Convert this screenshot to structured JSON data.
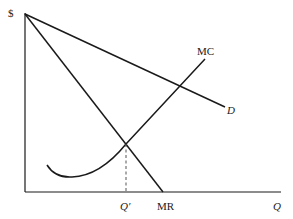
{
  "diagram": {
    "y_axis_label": "$",
    "x_axis_label": "Q",
    "curves": [
      {
        "name": "D",
        "label": "D",
        "type": "linear-demand"
      },
      {
        "name": "MR",
        "label": "MR",
        "type": "marginal-revenue"
      },
      {
        "name": "MC",
        "label": "MC",
        "type": "marginal-cost"
      }
    ],
    "markers": {
      "quantity_label": "Q′",
      "intersection": "MR = MC"
    },
    "colors": {
      "line": "#1a1a1a",
      "dashed": "#555555",
      "background": "#ffffff"
    }
  }
}
